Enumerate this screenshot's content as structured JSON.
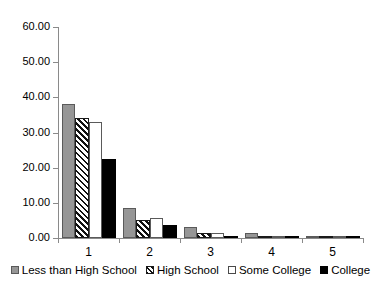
{
  "chart_data": {
    "type": "bar",
    "title": "",
    "xlabel": "",
    "ylabel": "",
    "categories": [
      "1",
      "2",
      "3",
      "4",
      "5"
    ],
    "ylim": [
      0,
      60
    ],
    "ytick_labels": [
      "0.00",
      "10.00",
      "20.00",
      "30.00",
      "40.00",
      "50.00",
      "60.00"
    ],
    "ytick_values": [
      0,
      10,
      20,
      30,
      40,
      50,
      60
    ],
    "grid": false,
    "legend_position": "bottom",
    "series": [
      {
        "name": "Less than High School",
        "style": "gray-fill",
        "values": [
          38.0,
          8.5,
          3.2,
          1.4,
          0.2
        ]
      },
      {
        "name": "High School",
        "style": "diagonal-hatch",
        "values": [
          34.0,
          5.0,
          1.3,
          0.2,
          0.1
        ]
      },
      {
        "name": "Some College",
        "style": "white-fill",
        "values": [
          33.0,
          5.8,
          1.5,
          0.2,
          0.1
        ]
      },
      {
        "name": "College",
        "style": "black-fill",
        "values": [
          22.5,
          3.8,
          0.6,
          0.1,
          0.1
        ]
      }
    ]
  },
  "legend": {
    "items": [
      {
        "label": "Less than High School"
      },
      {
        "label": "High School"
      },
      {
        "label": "Some College"
      },
      {
        "label": "College"
      }
    ]
  }
}
